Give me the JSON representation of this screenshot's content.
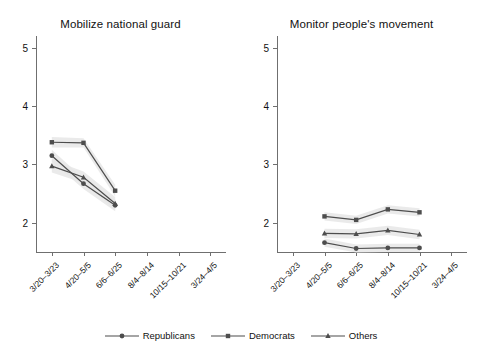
{
  "figure": {
    "background": "#ffffff",
    "series_color": "#4d4d4d",
    "band_color": "#e6e6e6",
    "axis_color": "#6f6f6f"
  },
  "legend": {
    "position": "bottom-center",
    "items": [
      {
        "label": "Republicans",
        "marker": "circle-marker",
        "color": "#4d4d4d"
      },
      {
        "label": "Democrats",
        "marker": "square-marker",
        "color": "#4d4d4d"
      },
      {
        "label": "Others",
        "marker": "triangle-marker",
        "color": "#4d4d4d"
      }
    ]
  },
  "chart_data": [
    {
      "type": "line",
      "title": "Mobilize national guard",
      "xlabel": "",
      "ylabel": "",
      "ylim": [
        1.5,
        5.2
      ],
      "yticks": [
        2,
        3,
        4,
        5
      ],
      "ytick_labels": [
        "2",
        "3",
        "4",
        "5"
      ],
      "grid": false,
      "categories": [
        "3/20–3/23",
        "4/20–5/5",
        "6/6–6/25",
        "8/4–8/14",
        "10/15–10/21",
        "3/24–4/5"
      ],
      "series": [
        {
          "name": "Republicans",
          "marker": "circle-marker",
          "values": [
            3.15,
            2.67,
            2.3,
            null,
            null,
            null
          ],
          "ci_low": [
            3.05,
            2.58,
            2.2,
            null,
            null,
            null
          ],
          "ci_high": [
            3.25,
            2.76,
            2.4,
            null,
            null,
            null
          ]
        },
        {
          "name": "Democrats",
          "marker": "square-marker",
          "values": [
            3.38,
            3.37,
            2.55,
            null,
            null,
            null
          ],
          "ci_low": [
            3.29,
            3.29,
            2.45,
            null,
            null,
            null
          ],
          "ci_high": [
            3.47,
            3.45,
            2.65,
            null,
            null,
            null
          ]
        },
        {
          "name": "Others",
          "marker": "triangle-marker",
          "values": [
            2.97,
            2.78,
            2.33,
            null,
            null,
            null
          ],
          "ci_low": [
            2.86,
            2.68,
            2.22,
            null,
            null,
            null
          ],
          "ci_high": [
            3.08,
            2.88,
            2.44,
            null,
            null,
            null
          ]
        }
      ]
    },
    {
      "type": "line",
      "title": "Monitor people's movement",
      "xlabel": "",
      "ylabel": "",
      "ylim": [
        1.5,
        5.2
      ],
      "yticks": [
        2,
        3,
        4,
        5
      ],
      "ytick_labels": [
        "2",
        "3",
        "4",
        "5"
      ],
      "grid": false,
      "categories": [
        "3/20–3/23",
        "4/20–5/5",
        "6/6–6/25",
        "8/4–8/14",
        "10/15–10/21",
        "3/24–4/5"
      ],
      "series": [
        {
          "name": "Republicans",
          "marker": "circle-marker",
          "values": [
            null,
            1.66,
            1.56,
            1.57,
            1.57,
            null
          ],
          "ci_low": [
            null,
            1.59,
            1.49,
            1.5,
            1.5,
            null
          ],
          "ci_high": [
            null,
            1.73,
            1.63,
            1.64,
            1.64,
            null
          ]
        },
        {
          "name": "Democrats",
          "marker": "square-marker",
          "values": [
            null,
            2.11,
            2.05,
            2.23,
            2.18,
            null
          ],
          "ci_low": [
            null,
            2.04,
            1.98,
            2.16,
            2.11,
            null
          ],
          "ci_high": [
            null,
            2.18,
            2.12,
            2.3,
            2.25,
            null
          ]
        },
        {
          "name": "Others",
          "marker": "triangle-marker",
          "values": [
            null,
            1.82,
            1.81,
            1.87,
            1.8,
            null
          ],
          "ci_low": [
            null,
            1.74,
            1.73,
            1.79,
            1.72,
            null
          ],
          "ci_high": [
            null,
            1.9,
            1.89,
            1.95,
            1.88,
            null
          ]
        }
      ]
    }
  ]
}
